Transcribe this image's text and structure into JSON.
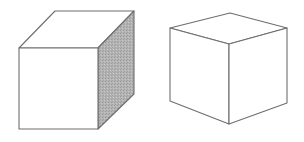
{
  "figure": {
    "colors": {
      "background": "#ffffff",
      "stroke": "#6e6e6e",
      "shade": "#a8a8a8"
    },
    "cubes": [
      {
        "id": "left-cube",
        "style": "oblique projection, right side face shaded",
        "faces": {
          "front": "19,48 98,48 98,129 19,129",
          "top": "19,48 55,11 134,11 98,48",
          "right": "98,48 134,11 134,94 98,129"
        }
      },
      {
        "id": "right-cube",
        "style": "isometric-like projection, unshaded",
        "faces": {
          "top": "170,28 230,13 287,28 229,44",
          "left": "170,28 229,44 229,124 170,101",
          "right": "229,44 287,28 287,103 229,124"
        }
      }
    ]
  }
}
